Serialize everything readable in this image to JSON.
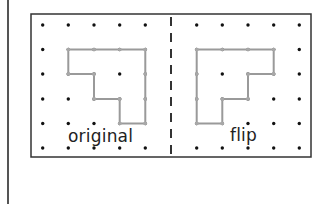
{
  "diagram": {
    "frame": {
      "x": 31,
      "y": 14,
      "width": 280,
      "height": 143,
      "stroke": "#333333"
    },
    "mirror_line": {
      "x": 171,
      "style": "dashed",
      "color": "#333333"
    },
    "grid": {
      "rows_y": [
        25,
        49.5,
        74,
        99,
        123.5,
        148
      ],
      "left_cols_x": [
        42.7,
        68.3,
        94,
        119.7,
        145.3
      ],
      "right_cols_x": [
        196.7,
        222.3,
        248,
        273.7,
        299.3
      ],
      "dot_color": "#111111"
    },
    "shape_color": "#9a9a9a",
    "original": {
      "label": "original",
      "vertices": [
        [
          1,
          1
        ],
        [
          4,
          1
        ],
        [
          4,
          4
        ],
        [
          3,
          4
        ],
        [
          3,
          3
        ],
        [
          2,
          3
        ],
        [
          2,
          2
        ],
        [
          1,
          2
        ]
      ]
    },
    "flip": {
      "label": "flip",
      "vertices": [
        [
          0,
          1
        ],
        [
          3,
          1
        ],
        [
          3,
          2
        ],
        [
          2,
          2
        ],
        [
          2,
          3
        ],
        [
          1,
          3
        ],
        [
          1,
          4
        ],
        [
          0,
          4
        ]
      ]
    }
  }
}
